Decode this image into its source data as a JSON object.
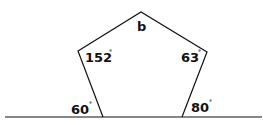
{
  "diagram": {
    "type": "pentagon-angles",
    "labels": {
      "top": "b",
      "upper_left": "152",
      "upper_right": "63",
      "bottom_left_exterior": "60",
      "bottom_right_exterior": "80",
      "degree_symbol": "°"
    },
    "stroke_color": "#111111"
  }
}
